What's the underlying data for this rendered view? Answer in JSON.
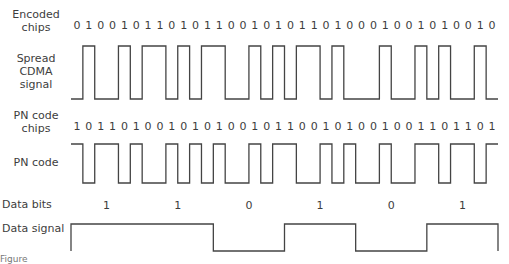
{
  "labels": {
    "encoded_chips": [
      "Encoded",
      "chips"
    ],
    "spread_signal": [
      "Spread",
      "CDMA",
      "signal"
    ],
    "pn_chips": [
      "PN code",
      "chips"
    ],
    "pn_code": "PN code",
    "data_bits": "Data bits",
    "data_signal": "Data signal"
  },
  "encoded_chips": [
    0,
    1,
    0,
    0,
    1,
    0,
    1,
    1,
    0,
    1,
    0,
    1,
    1,
    0,
    0,
    1,
    0,
    1,
    0,
    1,
    1,
    0,
    1,
    0,
    0,
    0,
    1,
    0,
    0,
    1,
    0,
    1,
    0,
    0,
    1,
    0
  ],
  "pn_chips": [
    1,
    0,
    1,
    1,
    0,
    1,
    0,
    0,
    1,
    0,
    1,
    0,
    1,
    0,
    0,
    1,
    0,
    1,
    1,
    0,
    0,
    1,
    0,
    1,
    0,
    0,
    1,
    0,
    0,
    1,
    1,
    0,
    1,
    1,
    0,
    1
  ],
  "data_bits": [
    1,
    1,
    0,
    1,
    0,
    1
  ],
  "caption": "Figure"
}
